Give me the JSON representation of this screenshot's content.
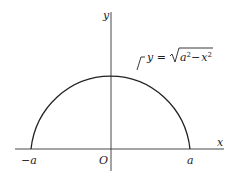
{
  "diagram": {
    "axes": {
      "x_label": "x",
      "y_label": "y",
      "origin_label": "O"
    },
    "ticks": {
      "left": "−a",
      "right": "a"
    },
    "curve": {
      "equation_lhs": "y =",
      "equation_radicand_a": "a",
      "equation_exp_a": "2",
      "equation_minus": "−",
      "equation_radicand_x": "x",
      "equation_exp_x": "2",
      "equation_text": "y = √(a² − x²)",
      "type": "semicircle",
      "center": [
        0,
        0
      ],
      "radius": "a"
    },
    "colors": {
      "line": "#222222",
      "background": "#ffffff"
    }
  }
}
